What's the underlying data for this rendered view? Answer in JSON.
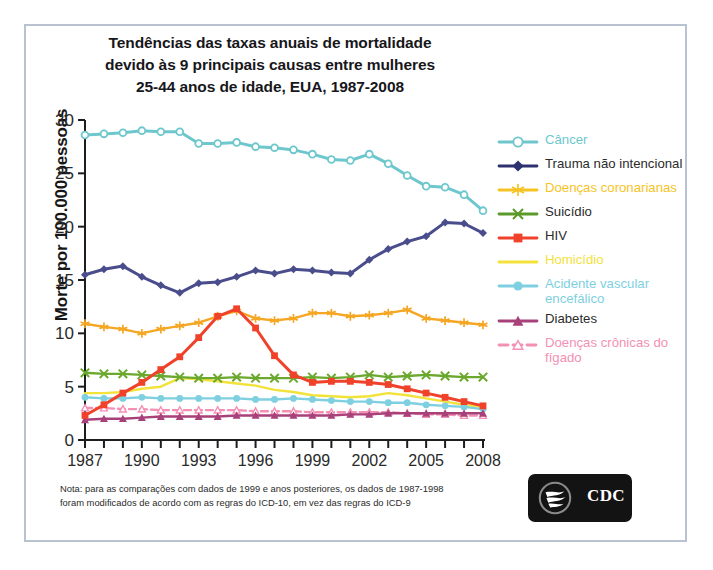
{
  "chart_data": {
    "type": "line",
    "title": "Tendências das taxas anuais de mortalidade devido às 9 principais causas entre mulheres 25-44 anos de idade, EUA, 1987-2008",
    "title_lines": [
      "Tendências das taxas anuais de mortalidade",
      "devido às 9 principais causas entre mulheres",
      "25-44 anos de idade, EUA, 1987-2008"
    ],
    "xlabel": "",
    "ylabel": "Morte por 100.000 pessoas",
    "xlim": [
      1987,
      2008
    ],
    "ylim": [
      0,
      30
    ],
    "yticks": [
      0,
      5,
      10,
      15,
      20,
      25,
      30
    ],
    "ytick_labels": [
      "0",
      "5",
      "10",
      "15",
      "20",
      "25",
      "30"
    ],
    "xticks": [
      1987,
      1988,
      1989,
      1990,
      1991,
      1992,
      1993,
      1994,
      1995,
      1996,
      1997,
      1998,
      1999,
      2000,
      2001,
      2002,
      2003,
      2004,
      2005,
      2006,
      2007,
      2008
    ],
    "xtick_labels_shown": [
      "1987",
      "1990",
      "1993",
      "1996",
      "1999",
      "2002",
      "2005",
      "2008"
    ],
    "grid": false,
    "legend_position": "right",
    "x": [
      1987,
      1988,
      1989,
      1990,
      1991,
      1992,
      1993,
      1994,
      1995,
      1996,
      1997,
      1998,
      1999,
      2000,
      2001,
      2002,
      2003,
      2004,
      2005,
      2006,
      2007,
      2008
    ],
    "series": [
      {
        "name": "Câncer",
        "color": "#6dc7cd",
        "marker": "open-circle",
        "dash": false,
        "values": [
          28.6,
          28.7,
          28.8,
          29.0,
          28.9,
          28.9,
          27.8,
          27.8,
          27.9,
          27.5,
          27.4,
          27.2,
          26.8,
          26.3,
          26.2,
          26.8,
          25.9,
          24.8,
          23.8,
          23.7,
          23.0,
          21.5
        ]
      },
      {
        "name": "Trauma não intencional",
        "color": "#4a4d8c",
        "marker": "diamond",
        "dash": false,
        "values": [
          15.5,
          16.0,
          16.3,
          15.3,
          14.5,
          13.8,
          14.7,
          14.8,
          15.3,
          15.9,
          15.6,
          16.0,
          15.9,
          15.7,
          15.6,
          16.9,
          17.9,
          18.6,
          19.1,
          20.4,
          20.3,
          19.4
        ]
      },
      {
        "name": "Doenças coronarianas",
        "color": "#f5a623",
        "marker": "star",
        "dash": false,
        "values": [
          10.9,
          10.6,
          10.4,
          10.0,
          10.4,
          10.7,
          11.0,
          11.6,
          12.1,
          11.4,
          11.2,
          11.4,
          11.9,
          11.9,
          11.6,
          11.7,
          11.9,
          12.2,
          11.4,
          11.2,
          11.0,
          10.8
        ]
      },
      {
        "name": "Suicídio",
        "color": "#6aa82e",
        "marker": "x",
        "dash": false,
        "values": [
          6.3,
          6.2,
          6.2,
          6.1,
          6.0,
          5.9,
          5.8,
          5.8,
          5.9,
          5.8,
          5.8,
          5.8,
          5.9,
          5.8,
          5.9,
          6.1,
          5.9,
          6.0,
          6.1,
          6.0,
          5.9,
          5.9
        ]
      },
      {
        "name": "HIV",
        "color": "#f0422a",
        "marker": "square",
        "dash": false,
        "values": [
          2.3,
          3.3,
          4.4,
          5.4,
          6.6,
          7.8,
          9.6,
          11.6,
          12.3,
          10.5,
          7.9,
          6.1,
          5.4,
          5.5,
          5.5,
          5.4,
          5.2,
          4.8,
          4.4,
          4.0,
          3.6,
          3.2
        ]
      },
      {
        "name": "Homicídio",
        "color": "#f2e23a",
        "marker": "none",
        "dash": false,
        "values": [
          4.4,
          4.4,
          4.5,
          4.8,
          5.0,
          5.8,
          5.7,
          5.5,
          5.3,
          5.1,
          4.7,
          4.5,
          4.2,
          4.1,
          4.0,
          4.1,
          4.4,
          4.2,
          3.9,
          3.6,
          3.3,
          3.1
        ]
      },
      {
        "name": "Acidente vascular encefálico",
        "color": "#7ed0e0",
        "marker": "circle",
        "dash": false,
        "values": [
          4.0,
          3.9,
          3.9,
          4.0,
          3.9,
          3.9,
          3.9,
          3.9,
          3.9,
          3.8,
          3.8,
          3.9,
          3.8,
          3.7,
          3.6,
          3.6,
          3.5,
          3.5,
          3.3,
          3.2,
          3.1,
          2.9
        ]
      },
      {
        "name": "Diabetes",
        "color": "#a8407a",
        "marker": "triangle",
        "dash": false,
        "values": [
          1.9,
          2.0,
          2.0,
          2.1,
          2.2,
          2.2,
          2.2,
          2.2,
          2.3,
          2.3,
          2.3,
          2.3,
          2.3,
          2.3,
          2.4,
          2.4,
          2.5,
          2.5,
          2.5,
          2.5,
          2.5,
          2.5
        ]
      },
      {
        "name": "Doenças crônicas do fígado",
        "color": "#f490b4",
        "marker": "open-triangle",
        "dash": true,
        "values": [
          3.0,
          3.0,
          2.9,
          2.9,
          2.8,
          2.8,
          2.8,
          2.8,
          2.8,
          2.7,
          2.7,
          2.7,
          2.6,
          2.6,
          2.6,
          2.6,
          2.6,
          2.5,
          2.4,
          2.4,
          2.3,
          2.3
        ]
      }
    ]
  },
  "legend": {
    "items": [
      {
        "label": "Câncer",
        "color": "#6dc7cd",
        "marker": "open-circle",
        "dash": false
      },
      {
        "label": "Trauma não intencional",
        "color": "#2e3170",
        "marker": "diamond",
        "dash": false
      },
      {
        "label": "Doenças coronarianas",
        "color": "#f5c324",
        "marker": "star",
        "dash": false
      },
      {
        "label": "Suicídio",
        "color": "#5c9a2a",
        "marker": "x",
        "dash": false
      },
      {
        "label": "HIV",
        "color": "#f0422a",
        "marker": "square",
        "dash": false
      },
      {
        "label": "Homicídio",
        "color": "#f2e23a",
        "marker": "none",
        "dash": false
      },
      {
        "label": "Acidente vascular encefálico",
        "color": "#7ed0e0",
        "marker": "circle",
        "dash": false
      },
      {
        "label": "Diabetes",
        "color": "#a8407a",
        "marker": "triangle",
        "dash": false
      },
      {
        "label": "Doenças crônicas do fígado",
        "color": "#f490b4",
        "marker": "open-triangle",
        "dash": true
      }
    ]
  },
  "note": {
    "line1": "Nota: para as comparações com dados de 1999 e anos posteriores, os dados de 1987-1998",
    "line2": "foram modificados de acordo com as regras do ICD-10, em vez das regras do ICD-9"
  },
  "logo": {
    "text": "CDC",
    "alt": "cdc-hhs-logo"
  }
}
